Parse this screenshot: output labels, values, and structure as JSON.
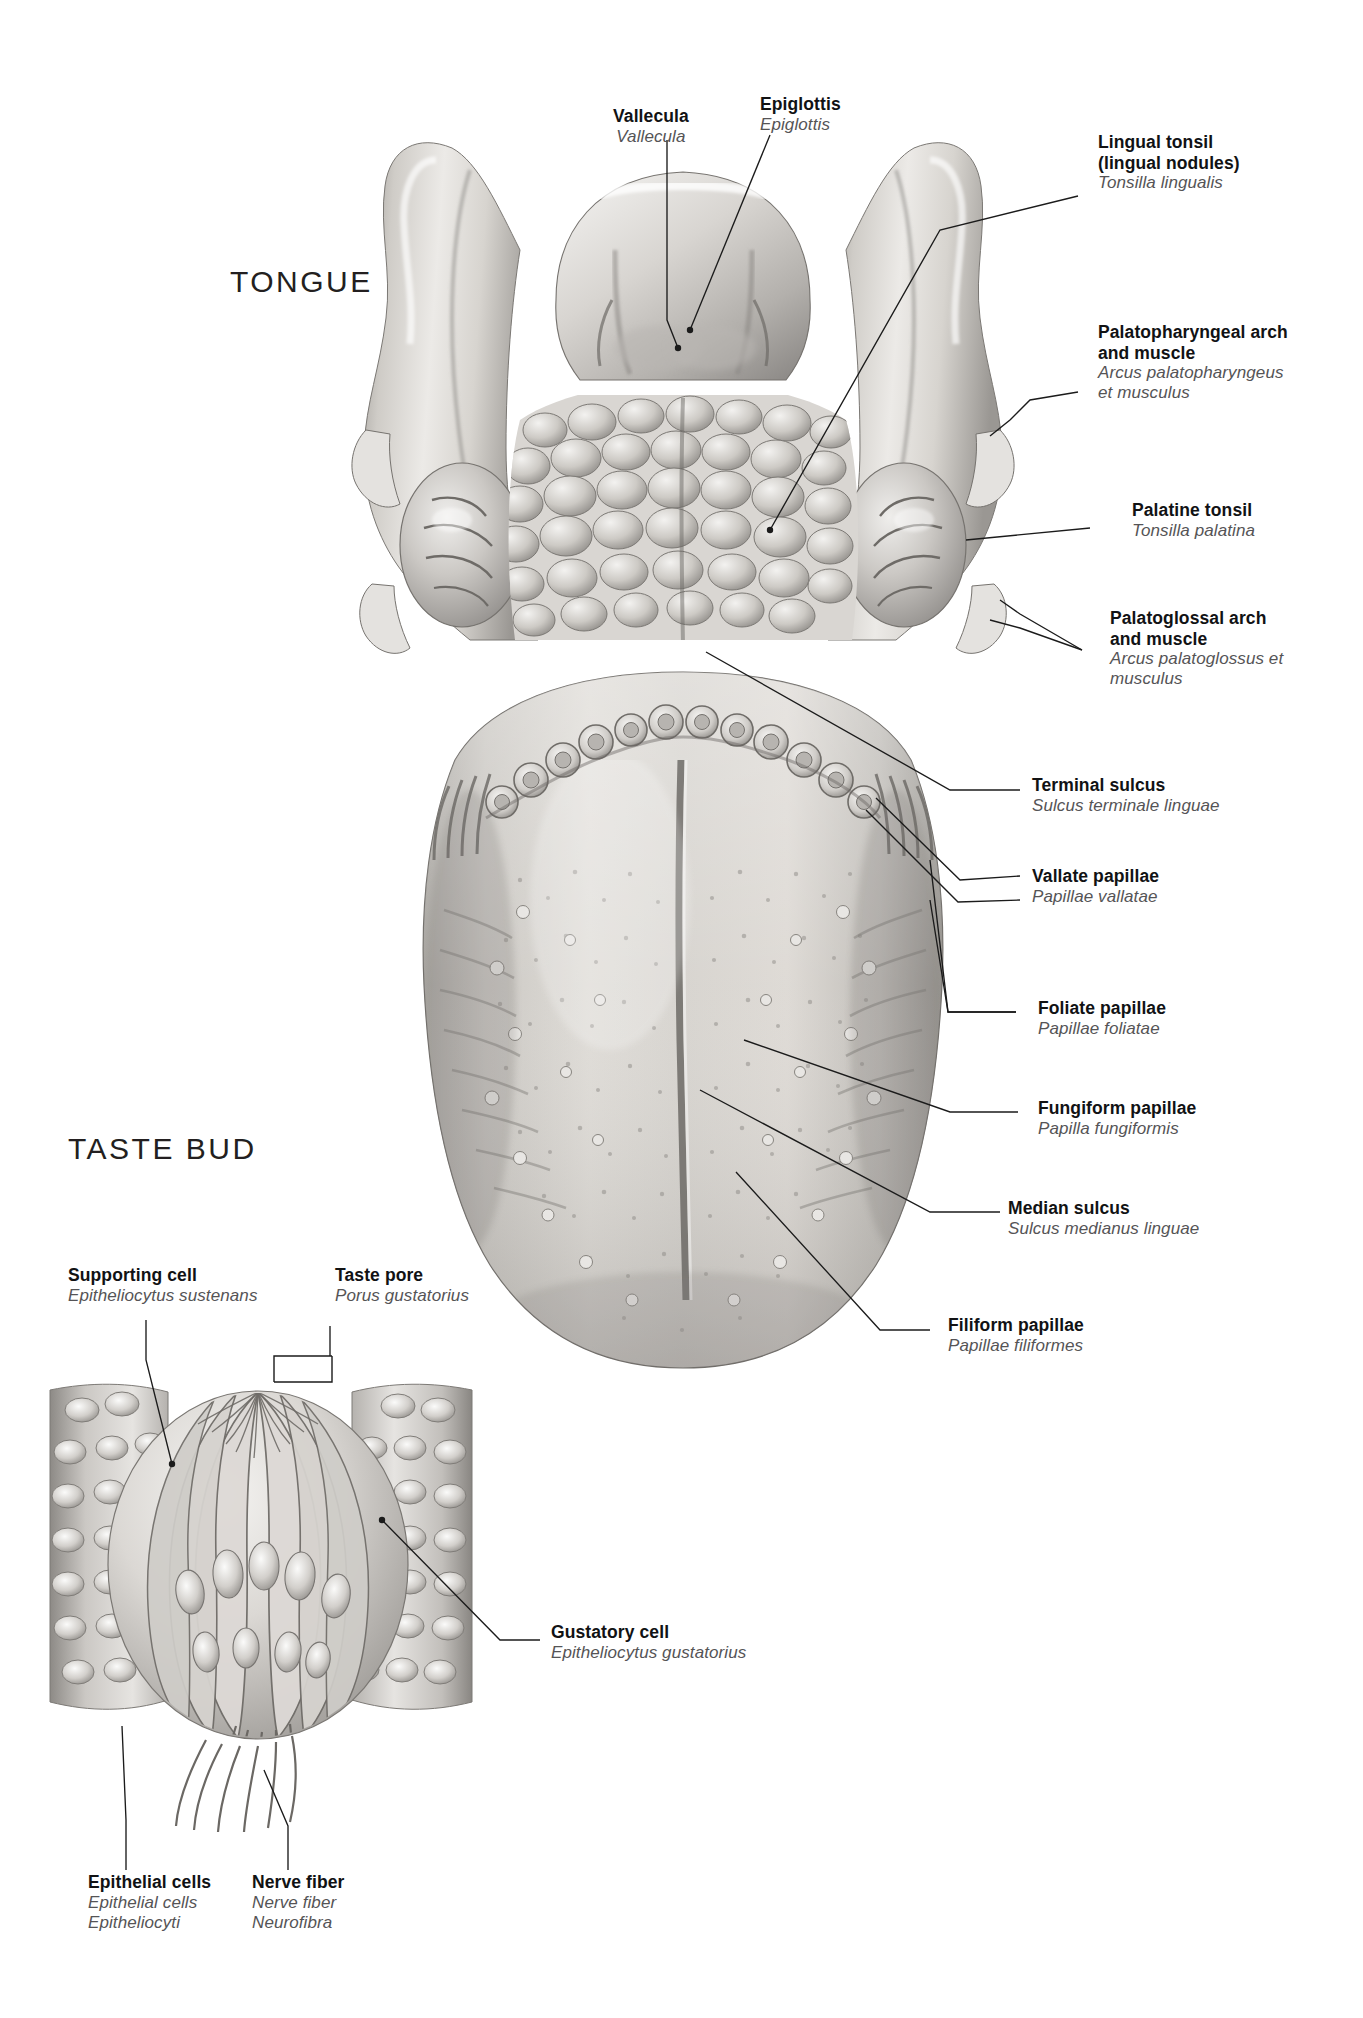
{
  "figure": {
    "sections": [
      {
        "id": "tongue",
        "title": "TONGUE"
      },
      {
        "id": "taste-bud",
        "title": "TASTE BUD"
      }
    ]
  },
  "tongue_labels": [
    {
      "id": "vallecula",
      "en": "Vallecula",
      "la": "Vallecula"
    },
    {
      "id": "epiglottis",
      "en": "Epiglottis",
      "la": "Epiglottis"
    },
    {
      "id": "lingual-tonsil",
      "en": "Lingual tonsil\n(lingual nodules)",
      "la": "Tonsilla lingualis"
    },
    {
      "id": "palatopharyngeal-arch",
      "en": "Palatopharyngeal arch\nand muscle",
      "la": "Arcus palatopharyngeus\net musculus"
    },
    {
      "id": "palatine-tonsil",
      "en": "Palatine tonsil",
      "la": "Tonsilla palatina"
    },
    {
      "id": "palatoglossal-arch",
      "en": "Palatoglossal arch\nand muscle",
      "la": "Arcus palatoglossus et\nmusculus"
    },
    {
      "id": "terminal-sulcus",
      "en": "Terminal sulcus",
      "la": "Sulcus terminale linguae"
    },
    {
      "id": "vallate-papillae",
      "en": "Vallate papillae",
      "la": "Papillae vallatae"
    },
    {
      "id": "foliate-papillae",
      "en": "Foliate papillae",
      "la": "Papillae foliatae"
    },
    {
      "id": "fungiform-papillae",
      "en": "Fungiform papillae",
      "la": "Papilla fungiformis"
    },
    {
      "id": "median-sulcus",
      "en": "Median sulcus",
      "la": "Sulcus medianus linguae"
    },
    {
      "id": "filiform-papillae",
      "en": "Filiform papillae",
      "la": "Papillae filiformes"
    }
  ],
  "tastebud_labels": [
    {
      "id": "supporting-cell",
      "en": "Supporting cell",
      "la": "Epitheliocytus sustenans"
    },
    {
      "id": "taste-pore",
      "en": "Taste pore",
      "la": "Porus gustatorius"
    },
    {
      "id": "gustatory-cell",
      "en": "Gustatory cell",
      "la": "Epitheliocytus gustatorius"
    },
    {
      "id": "epithelial-cells",
      "en": "Epithelial cells",
      "la": "Epithelial cells\nEpitheliocyti"
    },
    {
      "id": "nerve-fiber",
      "en": "Nerve fiber",
      "la": "Nerve fiber\nNeurofibra"
    }
  ],
  "colors": {
    "background": "#ffffff",
    "text_primary": "#111214",
    "text_latin": "#555456",
    "leader_line": "#1b1b1b",
    "tissue_light": "#e9e7e4",
    "tissue_mid": "#c5c2bd",
    "tissue_dark": "#8e8b87",
    "tissue_shadow": "#6d6a67"
  }
}
